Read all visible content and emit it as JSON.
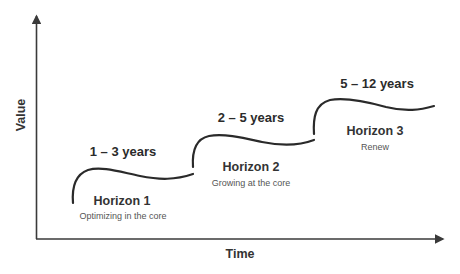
{
  "axes": {
    "x_label": "Time",
    "y_label": "Value"
  },
  "horizons": [
    {
      "name": "Horizon 1",
      "description": "Optimizing in the core",
      "timeframe": "1 – 3 years"
    },
    {
      "name": "Horizon 2",
      "description": "Growing at the core",
      "timeframe": "2 – 5 years"
    },
    {
      "name": "Horizon 3",
      "description": "Renew",
      "timeframe": "5 – 12 years"
    }
  ],
  "colors": {
    "line": "#2a2a2a",
    "axis": "#3a3a3a",
    "text": "#333333"
  }
}
